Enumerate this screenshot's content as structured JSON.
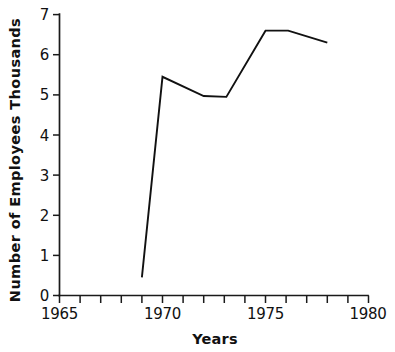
{
  "chart_data": {
    "type": "line",
    "title": "",
    "xlabel": "Years",
    "ylabel": "Number of Employees  Thousands",
    "xlim": [
      1965,
      1980
    ],
    "ylim": [
      0,
      7
    ],
    "grid": false,
    "legend": null,
    "x_ticks": [
      1965,
      1966,
      1967,
      1968,
      1969,
      1970,
      1971,
      1972,
      1973,
      1974,
      1975,
      1976,
      1977,
      1978,
      1979,
      1980
    ],
    "x_tick_labels": [
      "1965",
      "",
      "",
      "",
      "",
      "1970",
      "",
      "",
      "",
      "",
      "1975",
      "",
      "",
      "",
      "",
      "1980"
    ],
    "y_ticks": [
      0,
      1,
      2,
      3,
      4,
      5,
      6,
      7
    ],
    "y_tick_labels": [
      "0",
      "1",
      "2",
      "3",
      "4",
      "5",
      "6",
      "7"
    ],
    "series": [
      {
        "name": "Number of Employees",
        "color": "#111111",
        "x": [
          1969.0,
          1970.0,
          1972.0,
          1973.1,
          1975.0,
          1976.1,
          1978.0
        ],
        "values": [
          0.45,
          5.45,
          4.97,
          4.95,
          6.6,
          6.6,
          6.3
        ]
      }
    ]
  },
  "axis": {
    "x_label": "Years",
    "y_label": "Number of Employees  Thousands"
  }
}
